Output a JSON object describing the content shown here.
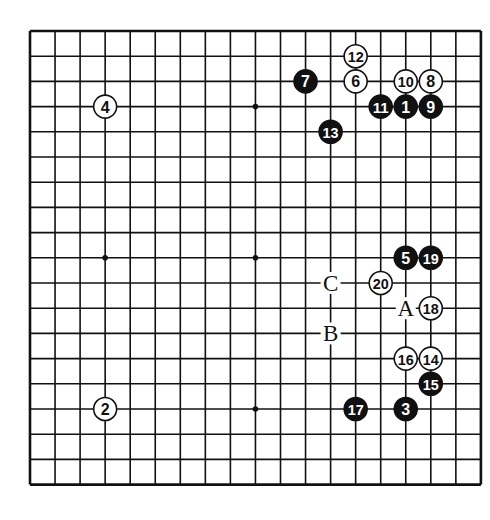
{
  "diagram": {
    "type": "go-board",
    "size": 19,
    "colors": {
      "line": "#111111",
      "black_stone": "#111111",
      "white_stone": "#ffffff",
      "background": "#ffffff"
    },
    "star_points": [
      [
        3,
        3
      ],
      [
        9,
        3
      ],
      [
        15,
        3
      ],
      [
        3,
        9
      ],
      [
        9,
        9
      ],
      [
        15,
        9
      ],
      [
        3,
        15
      ],
      [
        9,
        15
      ],
      [
        15,
        15
      ]
    ],
    "moves": [
      {
        "n": 1,
        "color": "black",
        "col": 15,
        "row": 3
      },
      {
        "n": 2,
        "color": "white",
        "col": 3,
        "row": 15
      },
      {
        "n": 3,
        "color": "black",
        "col": 15,
        "row": 15
      },
      {
        "n": 4,
        "color": "white",
        "col": 3,
        "row": 3
      },
      {
        "n": 5,
        "color": "black",
        "col": 15,
        "row": 9
      },
      {
        "n": 6,
        "color": "white",
        "col": 13,
        "row": 2
      },
      {
        "n": 7,
        "color": "black",
        "col": 11,
        "row": 2
      },
      {
        "n": 8,
        "color": "white",
        "col": 16,
        "row": 2
      },
      {
        "n": 9,
        "color": "black",
        "col": 16,
        "row": 3
      },
      {
        "n": 10,
        "color": "white",
        "col": 15,
        "row": 2
      },
      {
        "n": 11,
        "color": "black",
        "col": 14,
        "row": 3
      },
      {
        "n": 12,
        "color": "white",
        "col": 13,
        "row": 1
      },
      {
        "n": 13,
        "color": "black",
        "col": 12,
        "row": 4
      },
      {
        "n": 14,
        "color": "white",
        "col": 16,
        "row": 13
      },
      {
        "n": 15,
        "color": "black",
        "col": 16,
        "row": 14
      },
      {
        "n": 16,
        "color": "white",
        "col": 15,
        "row": 13
      },
      {
        "n": 17,
        "color": "black",
        "col": 13,
        "row": 15
      },
      {
        "n": 18,
        "color": "white",
        "col": 16,
        "row": 11
      },
      {
        "n": 19,
        "color": "black",
        "col": 16,
        "row": 9
      },
      {
        "n": 20,
        "color": "white",
        "col": 14,
        "row": 10
      }
    ],
    "markers": [
      {
        "label": "A",
        "col": 15,
        "row": 11
      },
      {
        "label": "B",
        "col": 12,
        "row": 12
      },
      {
        "label": "C",
        "col": 12,
        "row": 10
      }
    ]
  }
}
